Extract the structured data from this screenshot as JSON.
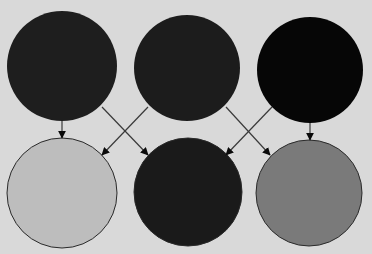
{
  "diagram": {
    "background": "#d9d9d9",
    "top_circles": [
      {
        "id": "top-left",
        "cx": 62,
        "cy": 66,
        "r": 55,
        "fill": "#1e1e1e"
      },
      {
        "id": "top-middle",
        "cx": 187,
        "cy": 68,
        "r": 53,
        "fill": "#1c1c1c"
      },
      {
        "id": "top-right",
        "cx": 310,
        "cy": 70,
        "r": 53,
        "fill": "#060606"
      }
    ],
    "bottom_circles": [
      {
        "id": "bottom-left",
        "cx": 62,
        "cy": 193,
        "r": 55,
        "fill": "#bdbdbd"
      },
      {
        "id": "bottom-middle",
        "cx": 188,
        "cy": 192,
        "r": 54,
        "fill": "#1a1a1a"
      },
      {
        "id": "bottom-right",
        "cx": 309,
        "cy": 193,
        "r": 53,
        "fill": "#7a7a7a"
      }
    ],
    "arrows": [
      {
        "from": "top-left",
        "to": "bottom-left",
        "x1": 62,
        "y1": 121,
        "x2": 62,
        "y2": 138
      },
      {
        "from": "top-left",
        "to": "bottom-middle",
        "x1": 102,
        "y1": 107,
        "x2": 148,
        "y2": 155
      },
      {
        "from": "top-middle",
        "to": "bottom-left",
        "x1": 148,
        "y1": 107,
        "x2": 102,
        "y2": 155
      },
      {
        "from": "top-middle",
        "to": "bottom-right",
        "x1": 226,
        "y1": 107,
        "x2": 270,
        "y2": 155
      },
      {
        "from": "top-right",
        "to": "bottom-middle",
        "x1": 272,
        "y1": 107,
        "x2": 226,
        "y2": 155
      },
      {
        "from": "top-right",
        "to": "bottom-right",
        "x1": 310,
        "y1": 123,
        "x2": 310,
        "y2": 140
      }
    ],
    "arrow_color": "#3a3a3a",
    "arrowhead_color": "#0a0a0a"
  }
}
